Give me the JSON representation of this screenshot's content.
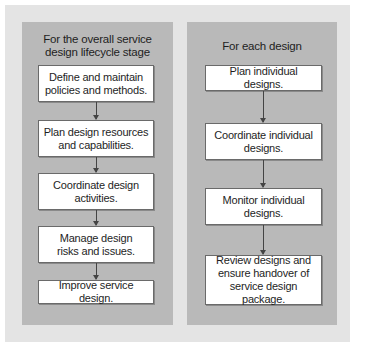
{
  "diagram": {
    "left_column": {
      "title": "For the overall service\ndesign lifecycle stage",
      "title_line1": "For the overall service",
      "title_line2": "design lifecycle stage",
      "steps": [
        {
          "label": "Define and maintain\npolicies and methods."
        },
        {
          "label": "Plan design resources\nand capabilities."
        },
        {
          "label": "Coordinate design\nactivities."
        },
        {
          "label": "Manage design\nrisks and issues."
        },
        {
          "label": "Improve service design."
        }
      ]
    },
    "right_column": {
      "title": "For each design",
      "steps": [
        {
          "label": "Plan individual designs."
        },
        {
          "label": "Coordinate individual\ndesigns."
        },
        {
          "label": "Monitor individual\ndesigns."
        },
        {
          "label": "Review designs and\nensure handover of\nservice design package."
        }
      ]
    },
    "colors": {
      "page_background": "#ffffff",
      "outer_panel": "#e4e4e4",
      "column_panel": "#b9b9b9",
      "step_box": "#ffffff",
      "step_border": "#6a6a6a",
      "arrow": "#444444",
      "text": "#1e1e1e"
    }
  }
}
